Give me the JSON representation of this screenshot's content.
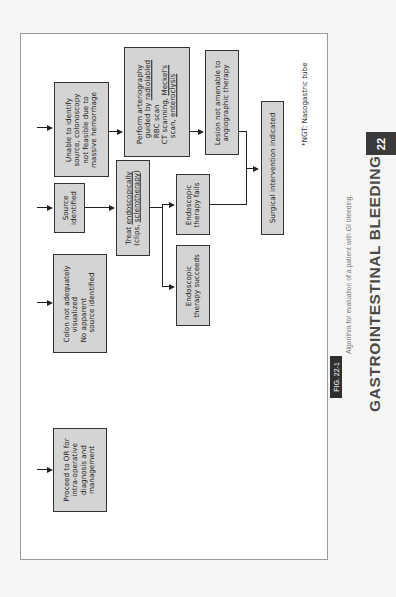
{
  "running_head": {
    "chapter_number": "22",
    "chapter_title": "GASTROINTESTINAL BLEEDING",
    "accent_color": "#3a3a3a"
  },
  "figure": {
    "label": "FIG. 22-1",
    "caption": "Algorithm for evaluation of a patient with GI bleeding.",
    "footnote": "*NGT: Nasogastric tube"
  },
  "flowchart": {
    "box_fill": "#d4d4d4",
    "nodes": {
      "unable_identify": [
        "Unable to identify",
        "source, colonoscopy",
        "not feasible due to",
        "massive hemorrhage"
      ],
      "arteriography": {
        "line1": "Perform arteriography",
        "line2_pre": "guided by ",
        "line2_u": "radiolabled",
        "line3": "RBC scan",
        "line4_pre": "CT scanning, ",
        "line4_u": "Meckel's",
        "line5_pre": "scan, ",
        "line5_u": "enteroclysis"
      },
      "lesion_not_amenable": [
        "Lesion not amenable to",
        "angiographic therapy"
      ],
      "surgical_intervention": [
        "Surgical intervention indicated"
      ],
      "source_identified": [
        "Source",
        "identified"
      ],
      "treat_endoscopically": {
        "line1_pre": "Treat ",
        "line1_u": "endoscopically",
        "line2_pre": "(clips, ",
        "line2_u": "sclerotherapy",
        "line2_post": ")"
      },
      "endoscopic_fails": [
        "Endoscopic",
        "therapy fails"
      ],
      "endoscopic_succeeds": [
        "Endoscopic",
        "therapy succeeds"
      ],
      "colon_not_visualized": [
        "Colon not adequately",
        "visualized",
        "No apparent",
        "source identified"
      ],
      "proceed_to_or": [
        "Proceed to OR for",
        "intra-operative",
        "diagnosis and",
        "management"
      ]
    }
  }
}
